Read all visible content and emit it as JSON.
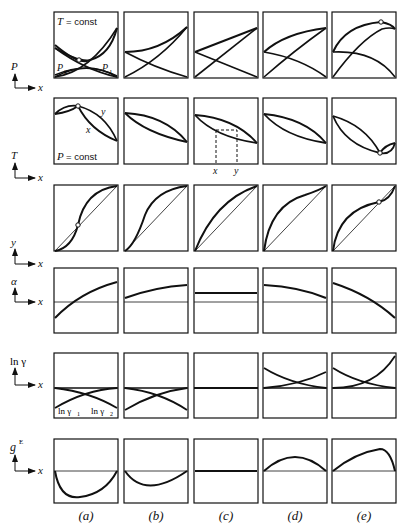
{
  "figure": {
    "columns": [
      {
        "id": "a",
        "label": "(a)"
      },
      {
        "id": "b",
        "label": "(b)"
      },
      {
        "id": "c",
        "label": "(c)"
      },
      {
        "id": "d",
        "label": "(d)"
      },
      {
        "id": "e",
        "label": "(e)"
      }
    ],
    "rows": [
      {
        "id": "pxy",
        "y_axis": "P",
        "x_axis": "x",
        "annotation": "T = const",
        "curve_labels": [
          "P₂",
          "P₁"
        ]
      },
      {
        "id": "txy",
        "y_axis": "T",
        "x_axis": "x",
        "annotation": "P = const",
        "curve_labels": [
          "y",
          "x"
        ],
        "tie_line_labels": [
          "x",
          "y"
        ]
      },
      {
        "id": "yx",
        "y_axis": "y",
        "x_axis": "x"
      },
      {
        "id": "alpha",
        "y_axis": "α",
        "x_axis": "x"
      },
      {
        "id": "lngamma",
        "y_axis": "ln γ",
        "x_axis": "x",
        "curve_labels": [
          "ln γ₁",
          "ln γ₂"
        ]
      },
      {
        "id": "ge",
        "y_axis": "gᴱ",
        "x_axis": "x"
      }
    ],
    "text": {
      "T_const": "T = const",
      "P_const": "P = const",
      "P2": "P",
      "P2_sub": "2",
      "P1": "P",
      "P1_sub": "1",
      "y_curve": "y",
      "x_curve": "x",
      "tie_x": "x",
      "tie_y": "y",
      "lng1": "ln γ",
      "lng1_sub": "1",
      "lng2": "ln γ",
      "lng2_sub": "2",
      "axis_P": "P",
      "axis_T": "T",
      "axis_y": "y",
      "axis_alpha": "α",
      "axis_lngamma": "ln γ",
      "axis_g": "g",
      "axis_g_sup": "E",
      "axis_x": "x"
    },
    "colors": {
      "line": "#111111",
      "background": "#ffffff"
    }
  }
}
